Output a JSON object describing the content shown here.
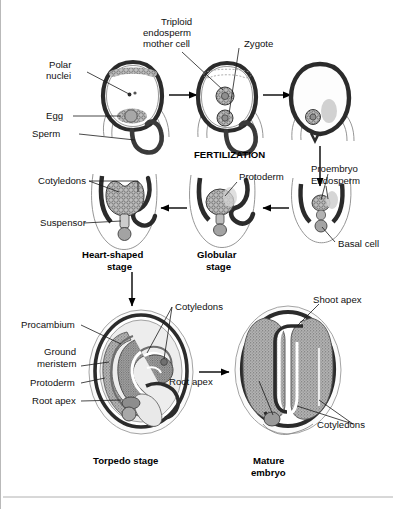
{
  "figure": {
    "title_visible": false,
    "background_color": "#ffffff",
    "ink_color": "#1a1a1a",
    "tissue_fill": "#9e9e9e",
    "light_fill": "#e6e6e6",
    "wall_color": "#2b2b2b"
  },
  "process_label": {
    "fertilization": "FERTILIZATION"
  },
  "row_top": {
    "stage1": {
      "labels": [
        {
          "id": "polar-nuclei",
          "line1": "Polar",
          "line2": "nuclei"
        },
        {
          "id": "egg",
          "text": "Egg"
        },
        {
          "id": "sperm",
          "text": "Sperm"
        }
      ]
    },
    "stage2": {
      "labels": [
        {
          "id": "triploid-endosperm-mother-cell",
          "line1": "Triploid",
          "line2": "endosperm",
          "line3": "mother cell"
        },
        {
          "id": "zygote",
          "text": "Zygote"
        }
      ]
    },
    "stage3": {
      "labels": []
    }
  },
  "row_middle": {
    "proembryo_stage": {
      "labels": [
        {
          "id": "proembryo",
          "text": "Proembryo"
        },
        {
          "id": "endosperm",
          "text": "Endosperm"
        },
        {
          "id": "basal-cell",
          "text": "Basal cell"
        }
      ]
    },
    "globular_stage": {
      "name_line1": "Globular",
      "name_line2": "stage",
      "labels": [
        {
          "id": "protoderm",
          "text": "Protoderm"
        }
      ]
    },
    "heart_stage": {
      "name_line1": "Heart-shaped",
      "name_line2": "stage",
      "labels": [
        {
          "id": "cotyledons",
          "text": "Cotyledons"
        },
        {
          "id": "suspensor",
          "text": "Suspensor"
        }
      ]
    }
  },
  "row_bottom": {
    "torpedo_stage": {
      "name": "Torpedo stage",
      "labels": [
        {
          "id": "procambium",
          "text": "Procambium"
        },
        {
          "id": "ground-meristem",
          "line1": "Ground",
          "line2": "meristem"
        },
        {
          "id": "protoderm",
          "text": "Protoderm"
        },
        {
          "id": "root-apex",
          "text": "Root apex"
        },
        {
          "id": "cotyledons",
          "text": "Cotyledons"
        }
      ]
    },
    "mature_embryo": {
      "name_line1": "Mature",
      "name_line2": "embryo",
      "labels": [
        {
          "id": "shoot-apex",
          "text": "Shoot apex"
        },
        {
          "id": "root-apex",
          "text": "Root apex"
        },
        {
          "id": "cotyledons",
          "text": "Cotyledons"
        }
      ]
    }
  }
}
